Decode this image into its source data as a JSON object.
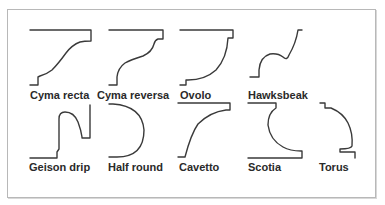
{
  "diagram": {
    "line_color": "#3a3a3a",
    "frame_color": "#b8b8b8",
    "rows": [
      {
        "items": [
          {
            "id": "cyma-recta",
            "label": "Cyma recta"
          },
          {
            "id": "cyma-reversa",
            "label": "Cyma reversa"
          },
          {
            "id": "ovolo",
            "label": "Ovolo"
          },
          {
            "id": "hawksbeak",
            "label": "Hawksbeak"
          }
        ]
      },
      {
        "items": [
          {
            "id": "geison-drip",
            "label": "Geison drip"
          },
          {
            "id": "half-round",
            "label": "Half round"
          },
          {
            "id": "cavetto",
            "label": "Cavetto"
          },
          {
            "id": "scotia",
            "label": "Scotia"
          },
          {
            "id": "torus",
            "label": "Torus"
          }
        ]
      }
    ]
  }
}
